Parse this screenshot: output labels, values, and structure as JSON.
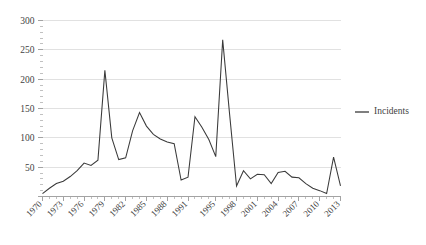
{
  "chart_data": {
    "type": "line",
    "title": "",
    "subtitle": "",
    "xlabel": "",
    "ylabel": "",
    "grid": "horizontal",
    "legend_position": "right",
    "xlim": [
      1970,
      2013
    ],
    "ylim": [
      0,
      300
    ],
    "ytick_values": [
      0,
      50,
      100,
      150,
      200,
      250,
      300
    ],
    "ytick_labels": [
      "",
      "50",
      "100",
      "150",
      "200",
      "250",
      "300"
    ],
    "yminor_step": 10,
    "xtick_labels": [
      "1970",
      "1973",
      "1976",
      "1979",
      "1982",
      "1985",
      "1988",
      "1991",
      "1995",
      "1998",
      "2001",
      "2004",
      "2007",
      "2010",
      "2013"
    ],
    "xtick_values": [
      1970,
      1973,
      1976,
      1979,
      1982,
      1985,
      1988,
      1991,
      1995,
      1998,
      2001,
      2004,
      2007,
      2010,
      2013
    ],
    "x": [
      1970,
      1971,
      1972,
      1973,
      1974,
      1975,
      1976,
      1977,
      1978,
      1979,
      1980,
      1981,
      1982,
      1983,
      1984,
      1985,
      1986,
      1987,
      1988,
      1989,
      1990,
      1991,
      1992,
      1993,
      1994,
      1995,
      1996,
      1997,
      1998,
      1999,
      2000,
      2001,
      2002,
      2003,
      2004,
      2005,
      2006,
      2007,
      2008,
      2009,
      2010,
      2011,
      2012,
      2013
    ],
    "series": [
      {
        "name": "Incidents",
        "color": "#3a3a3a",
        "values": [
          5,
          14,
          22,
          26,
          34,
          44,
          57,
          53,
          62,
          215,
          100,
          63,
          66,
          112,
          143,
          120,
          106,
          98,
          93,
          90,
          28,
          33,
          136,
          118,
          97,
          68,
          267,
          140,
          18,
          44,
          30,
          38,
          37,
          22,
          41,
          43,
          33,
          32,
          22,
          14,
          10,
          5,
          67,
          18
        ]
      }
    ],
    "legend_entries": [
      {
        "label": "Incidents",
        "color": "#3a3a3a",
        "marker": "line"
      }
    ],
    "colors": {
      "series": "#3a3a3a",
      "gridline": "#d9d9d9",
      "axis": "#8c8c8c",
      "text": "#3f3f3f",
      "background": "#ffffff"
    }
  }
}
